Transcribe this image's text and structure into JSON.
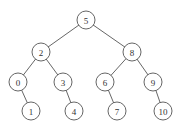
{
  "diagram": {
    "type": "binary-search-tree",
    "radius": 9,
    "nodes": [
      {
        "id": "n5",
        "label": "5",
        "x": 86,
        "y": 20
      },
      {
        "id": "n2",
        "label": "2",
        "x": 41,
        "y": 52
      },
      {
        "id": "n8",
        "label": "8",
        "x": 132,
        "y": 52
      },
      {
        "id": "n0",
        "label": "0",
        "x": 18,
        "y": 82
      },
      {
        "id": "n3",
        "label": "3",
        "x": 63,
        "y": 82
      },
      {
        "id": "n6",
        "label": "6",
        "x": 105,
        "y": 82
      },
      {
        "id": "n9",
        "label": "9",
        "x": 153,
        "y": 82
      },
      {
        "id": "n1",
        "label": "1",
        "x": 31,
        "y": 111
      },
      {
        "id": "n4",
        "label": "4",
        "x": 74,
        "y": 111
      },
      {
        "id": "n7",
        "label": "7",
        "x": 117,
        "y": 111
      },
      {
        "id": "n10",
        "label": "10",
        "x": 163,
        "y": 111
      }
    ],
    "edges": [
      [
        "n5",
        "n2"
      ],
      [
        "n5",
        "n8"
      ],
      [
        "n2",
        "n0"
      ],
      [
        "n2",
        "n3"
      ],
      [
        "n8",
        "n6"
      ],
      [
        "n8",
        "n9"
      ],
      [
        "n0",
        "n1"
      ],
      [
        "n3",
        "n4"
      ],
      [
        "n6",
        "n7"
      ],
      [
        "n9",
        "n10"
      ]
    ]
  }
}
